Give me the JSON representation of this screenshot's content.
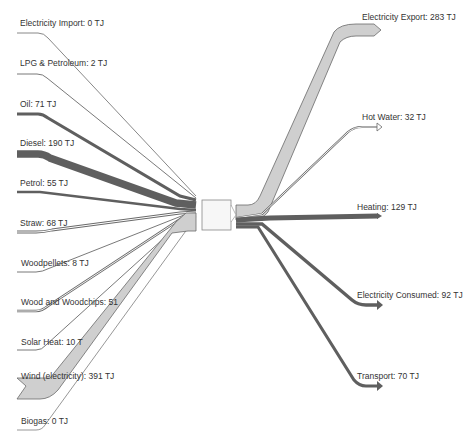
{
  "diagram": {
    "type": "sankey",
    "unit": "TJ",
    "hub": {
      "label": ""
    },
    "colors": {
      "dark": "#5f5f5f",
      "light": "#cfcfcf",
      "stroke": "#6a6a6a",
      "hub_fill": "#f7f7f7",
      "hub_stroke": "#888888"
    },
    "sources": [
      {
        "name": "Electricity Import",
        "value": 0,
        "label": "Electricity Import: 0 TJ"
      },
      {
        "name": "LPG & Petroleum",
        "value": 2,
        "label": "LPG & Petroleum: 2 TJ"
      },
      {
        "name": "Oil",
        "value": 71,
        "label": "Oil: 71 TJ"
      },
      {
        "name": "Diesel",
        "value": 190,
        "label": "Diesel: 190 TJ"
      },
      {
        "name": "Petrol",
        "value": 55,
        "label": "Petrol: 55 TJ"
      },
      {
        "name": "Straw",
        "value": 68,
        "label": "Straw: 68 TJ"
      },
      {
        "name": "Woodpellets",
        "value": 8,
        "label": "Woodpellets: 8 TJ"
      },
      {
        "name": "Wood and Woodchips",
        "value": 51,
        "label": "Wood and Woodchips: 51"
      },
      {
        "name": "Solar Heat",
        "value": 10,
        "label": "Solar Heat: 10 T"
      },
      {
        "name": "Wind (electricity)",
        "value": 391,
        "label": "Wind (electricity): 391 TJ"
      },
      {
        "name": "Biogas",
        "value": 0,
        "label": "Biogas: 0 TJ"
      }
    ],
    "targets": [
      {
        "name": "Electricity Export",
        "value": 283,
        "label": "Electricity Export: 283 TJ"
      },
      {
        "name": "Hot Water",
        "value": 32,
        "label": "Hot Water: 32 TJ"
      },
      {
        "name": "Heating",
        "value": 129,
        "label": "Heating: 129 TJ"
      },
      {
        "name": "Electricity Consumed",
        "value": 92,
        "label": "Electricity Consumed: 92 TJ"
      },
      {
        "name": "Transport",
        "value": 70,
        "label": "Transport: 70 TJ"
      }
    ]
  }
}
